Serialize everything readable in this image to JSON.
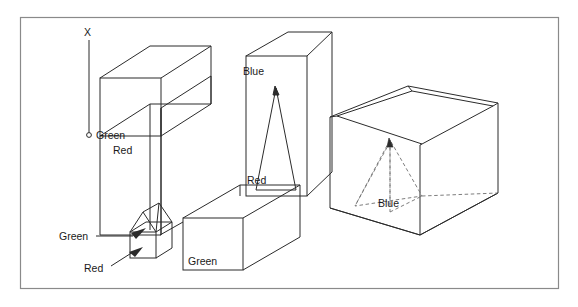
{
  "figure": {
    "type": "line-diagram",
    "background_color": "#ffffff",
    "line_color": "#2b2b2b",
    "frame_color": "#8a8a8a",
    "text_color": "#1a1a1a"
  },
  "axis": {
    "label": "X",
    "origin_marker": "o"
  },
  "labels": {
    "box1_green": "Green",
    "slab_red": "Red",
    "house_green": "Green",
    "house_red": "Red",
    "tall_blue": "Blue",
    "cone_red": "Red",
    "bar_green": "Green",
    "pyramid_blue": "Blue"
  },
  "objects": [
    {
      "name": "upper-left-cube",
      "label": "Green",
      "style": "solid"
    },
    {
      "name": "tall-slab",
      "label": "Red",
      "style": "solid"
    },
    {
      "name": "house-pyramid",
      "label": "Green",
      "style": "solid"
    },
    {
      "name": "house-cube",
      "label": "Red",
      "style": "solid"
    },
    {
      "name": "tall-box",
      "label": "Blue",
      "style": "solid"
    },
    {
      "name": "inner-cone",
      "label": "Red",
      "style": "solid"
    },
    {
      "name": "horizontal-bar",
      "label": "Green",
      "style": "solid"
    },
    {
      "name": "open-container",
      "label": "",
      "style": "solid"
    },
    {
      "name": "contained-pyramid",
      "label": "Blue",
      "style": "dashed"
    }
  ]
}
